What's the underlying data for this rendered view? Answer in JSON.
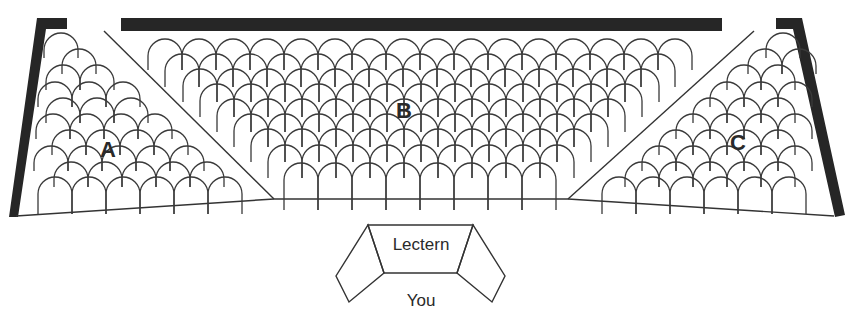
{
  "diagram": {
    "colors": {
      "wall": "#262626",
      "line": "#333333",
      "seat": "#3a3a3a",
      "text": "#2a2a2a"
    }
  },
  "sections": [
    {
      "id": "A",
      "label": "A",
      "label_pos": [
        108,
        157
      ]
    },
    {
      "id": "B",
      "label": "B",
      "label_pos": [
        404,
        118
      ]
    },
    {
      "id": "C",
      "label": "C",
      "label_pos": [
        738,
        150
      ]
    }
  ],
  "lectern": {
    "label": "Lectern"
  },
  "speaker": {
    "label": "You"
  },
  "seating": {
    "seat_width": 34,
    "B_rows": [
      {
        "x": 148,
        "y": 39,
        "count": 16,
        "leg": 14
      },
      {
        "x": 165,
        "y": 54,
        "count": 15,
        "leg": 16
      },
      {
        "x": 183,
        "y": 69,
        "count": 14,
        "leg": 16
      },
      {
        "x": 200,
        "y": 84,
        "count": 13,
        "leg": 16
      },
      {
        "x": 217,
        "y": 99,
        "count": 12,
        "leg": 16
      },
      {
        "x": 234,
        "y": 114,
        "count": 11,
        "leg": 16
      },
      {
        "x": 251,
        "y": 129,
        "count": 10,
        "leg": 16
      },
      {
        "x": 268,
        "y": 145,
        "count": 9,
        "leg": 16
      },
      {
        "x": 284,
        "y": 163,
        "count": 8,
        "leg": 30
      }
    ],
    "A_rows": [
      {
        "x": 44,
        "y": 33,
        "count": 1,
        "leg": 8
      },
      {
        "x": 62,
        "y": 49,
        "count": 1,
        "leg": 8
      },
      {
        "x": 46,
        "y": 65,
        "count": 2,
        "leg": 8
      },
      {
        "x": 38,
        "y": 82,
        "count": 3,
        "leg": 8
      },
      {
        "x": 46,
        "y": 98,
        "count": 3,
        "leg": 8
      },
      {
        "x": 36,
        "y": 114,
        "count": 4,
        "leg": 8
      },
      {
        "x": 52,
        "y": 130,
        "count": 4,
        "leg": 8
      },
      {
        "x": 34,
        "y": 146,
        "count": 5,
        "leg": 8
      },
      {
        "x": 54,
        "y": 162,
        "count": 5,
        "leg": 8
      },
      {
        "x": 38,
        "y": 177,
        "count": 6,
        "leg": 20
      }
    ],
    "C_rows": [
      {
        "x": 766,
        "y": 33,
        "count": 1,
        "leg": 8
      },
      {
        "x": 748,
        "y": 49,
        "count": 2,
        "leg": 8
      },
      {
        "x": 727,
        "y": 65,
        "count": 2,
        "leg": 8
      },
      {
        "x": 710,
        "y": 82,
        "count": 3,
        "leg": 8
      },
      {
        "x": 693,
        "y": 98,
        "count": 3,
        "leg": 8
      },
      {
        "x": 676,
        "y": 114,
        "count": 4,
        "leg": 8
      },
      {
        "x": 659,
        "y": 130,
        "count": 4,
        "leg": 8
      },
      {
        "x": 642,
        "y": 146,
        "count": 5,
        "leg": 8
      },
      {
        "x": 625,
        "y": 162,
        "count": 5,
        "leg": 8
      },
      {
        "x": 602,
        "y": 177,
        "count": 6,
        "leg": 20
      }
    ]
  }
}
